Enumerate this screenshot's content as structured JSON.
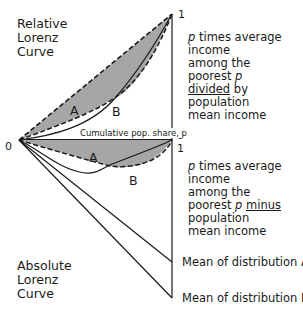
{
  "titles": {
    "relative": [
      "Relative",
      "Lorenz",
      "Curve"
    ],
    "absolute": [
      "Absolute",
      "Lorenz",
      "Curve"
    ]
  },
  "axis": {
    "x_label": "Cumulative pop. share, p",
    "origin": "0",
    "upper_top_tick": "1",
    "upper_zero_tick": "0",
    "lower_top_tick": "1"
  },
  "curve_labels": {
    "upper_A": "A",
    "upper_B": "B",
    "lower_A": "A",
    "lower_B": "B"
  },
  "descriptions": {
    "relative": {
      "line1_italic": "p",
      "line1_rest": " times average",
      "line2": "income",
      "line3": "among the",
      "line4_text": "poorest ",
      "line4_italic": "p",
      "line5_underlined": "divided",
      "line5_rest": " by",
      "line6": "population",
      "line7": "mean income"
    },
    "absolute": {
      "line1_italic": "p",
      "line1_rest": " times average",
      "line2": "income",
      "line3": "among the",
      "line4_text": "poorest ",
      "line4_italic": "p",
      "line4_space": " ",
      "line4_underlined": "minus",
      "line5": "population",
      "line6": "mean income"
    }
  },
  "endpoints": {
    "mean_A": "Mean of distribution A",
    "mean_B": "Mean of distribution B"
  },
  "colors": {
    "shade": "#a6a6a6",
    "line": "#1a1a1a",
    "background": "#ffffff"
  }
}
